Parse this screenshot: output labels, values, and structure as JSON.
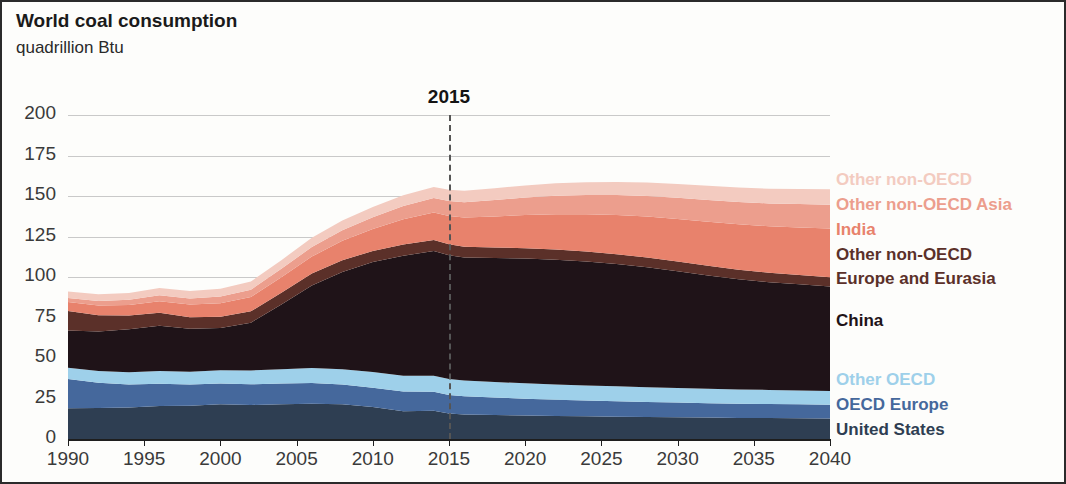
{
  "header": {
    "title": "World coal consumption",
    "subtitle": "quadrillion Btu"
  },
  "annotation": {
    "divider_label": "2015",
    "divider_year": 2015
  },
  "axis": {
    "y_ticks": [
      "200",
      "175",
      "150",
      "125",
      "100",
      "75",
      "50",
      "25",
      "0"
    ],
    "x_ticks": [
      "1990",
      "1995",
      "2000",
      "2005",
      "2010",
      "2015",
      "2020",
      "2025",
      "2030",
      "2035",
      "2040"
    ]
  },
  "legend": [
    {
      "label": "Other non-OECD",
      "color": "#f3cbc0",
      "top": 55
    },
    {
      "label": "Other non-OECD Asia",
      "color": "#ec9e8d",
      "top": 80
    },
    {
      "label": "India",
      "color": "#e8826c",
      "top": 105
    },
    {
      "label": "Other non-OECD",
      "color": "#5b3029",
      "top": 130
    },
    {
      "label": "Europe and Eurasia",
      "color": "#5b3029",
      "top": 154
    },
    {
      "label": "China",
      "color": "#1f1318",
      "top": 196
    },
    {
      "label": "Other OECD",
      "color": "#9ed0ea",
      "top": 255
    },
    {
      "label": "OECD Europe",
      "color": "#45689c",
      "top": 280
    },
    {
      "label": "United States",
      "color": "#2e3e52",
      "top": 305
    }
  ],
  "chart_data": {
    "type": "area",
    "title": "World coal consumption",
    "subtitle": "quadrillion Btu",
    "xlabel": "",
    "ylabel": "quadrillion Btu",
    "xlim": [
      1990,
      2040
    ],
    "ylim": [
      0,
      200
    ],
    "ytick_step": 25,
    "grid": true,
    "legend_position": "right",
    "stacked": true,
    "stack_order_bottom_to_top": [
      "United States",
      "OECD Europe",
      "Other OECD",
      "China",
      "Other non-OECD Europe and Eurasia",
      "India",
      "Other non-OECD Asia",
      "Other non-OECD"
    ],
    "x": [
      1990,
      1992,
      1994,
      1996,
      1998,
      2000,
      2002,
      2004,
      2006,
      2008,
      2010,
      2012,
      2014,
      2015,
      2016,
      2018,
      2020,
      2022,
      2024,
      2026,
      2028,
      2030,
      2032,
      2034,
      2036,
      2038,
      2040
    ],
    "series": [
      {
        "name": "United States",
        "color": "#2e3e52",
        "values": [
          19.0,
          19.2,
          19.5,
          20.3,
          20.6,
          21.5,
          21.0,
          21.5,
          21.8,
          21.4,
          19.8,
          17.1,
          17.5,
          15.8,
          15.2,
          14.8,
          14.5,
          14.2,
          14.0,
          13.8,
          13.6,
          13.4,
          13.2,
          13.0,
          12.9,
          12.8,
          12.7
        ]
      },
      {
        "name": "OECD Europe",
        "color": "#45689c",
        "values": [
          18.0,
          15.5,
          14.2,
          13.8,
          13.0,
          12.7,
          12.8,
          12.7,
          12.8,
          12.2,
          11.8,
          12.2,
          11.6,
          11.4,
          11.2,
          10.8,
          10.4,
          10.1,
          9.8,
          9.5,
          9.3,
          9.1,
          8.9,
          8.8,
          8.7,
          8.6,
          8.5
        ]
      },
      {
        "name": "Other OECD",
        "color": "#9ed0ea",
        "values": [
          7.0,
          7.2,
          7.5,
          7.8,
          7.9,
          8.3,
          8.5,
          8.9,
          9.2,
          9.5,
          9.7,
          9.8,
          9.9,
          9.8,
          9.7,
          9.6,
          9.5,
          9.4,
          9.3,
          9.2,
          9.1,
          9.0,
          8.9,
          8.8,
          8.7,
          8.6,
          8.5
        ]
      },
      {
        "name": "China",
        "color": "#1f1318",
        "values": [
          23.0,
          24.5,
          26.5,
          28.0,
          26.5,
          26.0,
          29.5,
          40.0,
          51.0,
          60.0,
          68.0,
          74.0,
          77.0,
          76.5,
          76.0,
          76.5,
          77.0,
          77.0,
          76.5,
          75.5,
          74.0,
          72.0,
          70.0,
          68.0,
          66.5,
          65.5,
          64.5
        ]
      },
      {
        "name": "Other non-OECD Europe and Eurasia",
        "color": "#5b3029",
        "values": [
          12.0,
          10.0,
          8.5,
          8.0,
          7.2,
          7.0,
          7.0,
          7.2,
          7.3,
          7.2,
          6.8,
          7.0,
          6.8,
          6.7,
          6.6,
          6.5,
          6.4,
          6.3,
          6.2,
          6.1,
          6.0,
          6.0,
          5.9,
          5.9,
          5.8,
          5.8,
          5.7
        ]
      },
      {
        "name": "India",
        "color": "#e8826c",
        "values": [
          5.5,
          6.0,
          6.5,
          7.2,
          7.8,
          8.3,
          8.8,
          9.6,
          10.5,
          12.0,
          13.5,
          15.5,
          17.0,
          17.5,
          18.0,
          19.2,
          20.5,
          21.8,
          23.0,
          24.2,
          25.3,
          26.3,
          27.2,
          28.0,
          28.7,
          29.3,
          30.0
        ]
      },
      {
        "name": "Other non-OECD Asia",
        "color": "#ec9e8d",
        "values": [
          2.5,
          2.8,
          3.2,
          3.6,
          3.8,
          4.2,
          4.6,
          5.2,
          5.9,
          6.6,
          7.3,
          8.2,
          8.9,
          9.2,
          9.5,
          10.1,
          10.7,
          11.3,
          11.8,
          12.3,
          12.7,
          13.1,
          13.5,
          13.8,
          14.1,
          14.4,
          14.7
        ]
      },
      {
        "name": "Other non-OECD",
        "color": "#f3cbc0",
        "values": [
          4.0,
          4.1,
          4.3,
          4.5,
          4.6,
          4.8,
          5.0,
          5.3,
          5.7,
          6.0,
          6.3,
          6.6,
          6.9,
          7.0,
          7.1,
          7.3,
          7.5,
          7.7,
          7.9,
          8.1,
          8.3,
          8.5,
          8.7,
          8.9,
          9.1,
          9.3,
          9.5
        ]
      }
    ]
  }
}
